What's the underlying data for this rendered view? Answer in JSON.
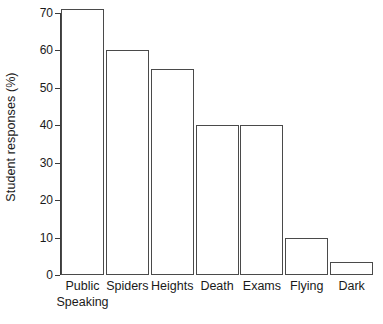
{
  "chart_data": {
    "type": "bar",
    "title": "",
    "subtitle": "",
    "xlabel": "",
    "ylabel": "Student responses (%)",
    "categories": [
      "Public Speaking",
      "Spiders",
      "Heights",
      "Death",
      "Exams",
      "Flying",
      "Dark"
    ],
    "category_lines": [
      [
        "Public",
        "Speaking"
      ],
      [
        "Spiders"
      ],
      [
        "Heights"
      ],
      [
        "Death"
      ],
      [
        "Exams"
      ],
      [
        "Flying"
      ],
      [
        "Dark"
      ]
    ],
    "values": [
      71,
      60,
      55,
      40,
      40,
      10,
      3.5
    ],
    "ylim": [
      0,
      70
    ],
    "ytick_values": [
      0,
      10,
      20,
      30,
      40,
      50,
      60,
      70
    ],
    "ytick_labels": [
      "0",
      "10",
      "20",
      "30",
      "40",
      "50",
      "60",
      "70"
    ],
    "grid": false,
    "legend": false,
    "legend_position": "none",
    "bar_fill_color": "#ffffff",
    "bar_border_color": "#4a4a4a",
    "axis_color": "#3b3b3b",
    "text_color": "#1a1a1a",
    "background_color": "#ffffff"
  }
}
